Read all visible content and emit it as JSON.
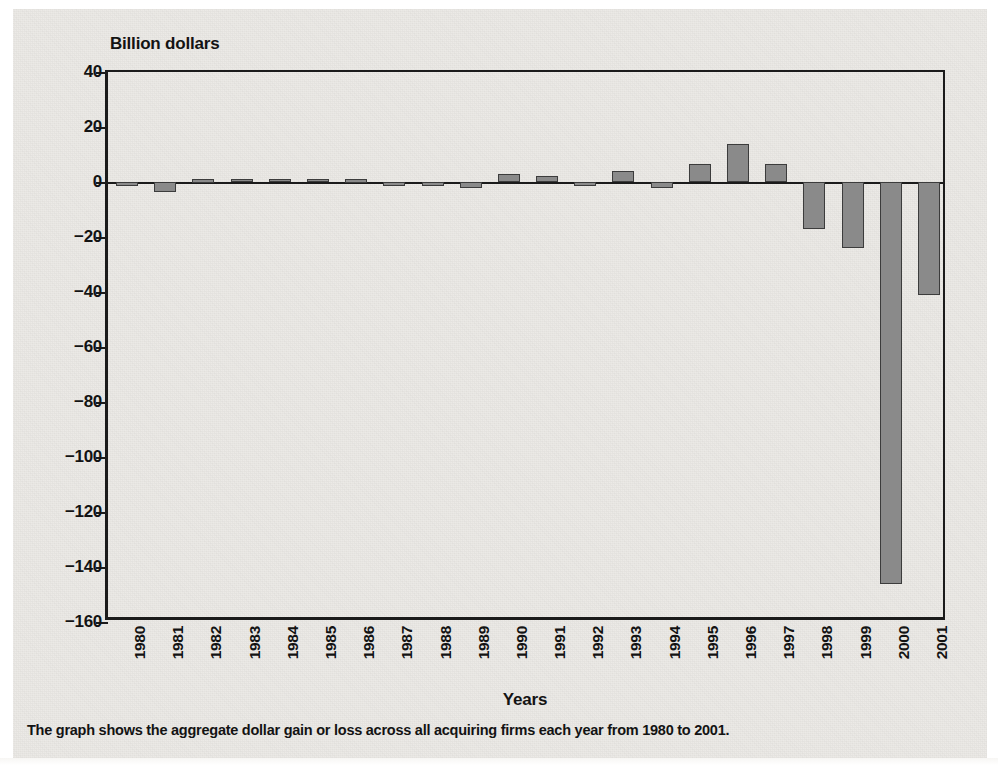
{
  "figure": {
    "y_axis_title": "Billion dollars",
    "x_axis_title": "Years",
    "caption": "The graph shows the aggregate dollar gain or loss across all acquiring firms each year from 1980 to 2001."
  },
  "colors": {
    "bar_fill": "#8a8a8a",
    "bar_border": "#3c3c3c",
    "axis": "#1b1b1b",
    "text": "#131313",
    "page_background": "#eceae6"
  },
  "chart_data": {
    "type": "bar",
    "title": "",
    "subtitle": "",
    "xlabel": "Years",
    "ylabel": "Billion dollars",
    "ylim": [
      -160,
      40
    ],
    "ytick_labels": [
      "40",
      "20",
      "0",
      "−20",
      "−40",
      "−60",
      "−80",
      "−100",
      "−120",
      "−140",
      "−160"
    ],
    "yticks": [
      40,
      20,
      0,
      -20,
      -40,
      -60,
      -80,
      -100,
      -120,
      -140,
      -160
    ],
    "grid": false,
    "legend": null,
    "categories": [
      "1980",
      "1981",
      "1982",
      "1983",
      "1984",
      "1985",
      "1986",
      "1987",
      "1988",
      "1989",
      "1990",
      "1991",
      "1992",
      "1993",
      "1994",
      "1995",
      "1996",
      "1997",
      "1998",
      "1999",
      "2000",
      "2001"
    ],
    "values": [
      -1.5,
      -3.5,
      1.0,
      1.2,
      1.2,
      1.2,
      1.0,
      -1.5,
      -1.5,
      -2.0,
      3.0,
      2.2,
      -1.5,
      4.0,
      -2.0,
      6.5,
      14.0,
      6.5,
      -17.0,
      -24.0,
      -146.0,
      -41.0
    ],
    "annotations": []
  }
}
